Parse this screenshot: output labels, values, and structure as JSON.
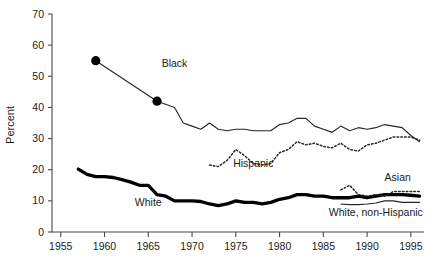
{
  "chart_data": {
    "type": "line",
    "title": "",
    "xlabel": "",
    "ylabel": "Percent",
    "xlim": [
      1954,
      1996.5
    ],
    "ylim": [
      0,
      70
    ],
    "ytick_values": [
      0,
      10,
      20,
      30,
      40,
      50,
      60,
      70
    ],
    "ytick_labels": [
      "0",
      "10",
      "20",
      "30",
      "40",
      "50",
      "60",
      "70"
    ],
    "xtick_values": [
      1955,
      1960,
      1965,
      1970,
      1975,
      1980,
      1985,
      1990,
      1995
    ],
    "xtick_labels": [
      "1955",
      "1960",
      "1965",
      "1970",
      "1975",
      "1980",
      "1985",
      "1990",
      "1995"
    ],
    "grid": false,
    "legend": "inline-labels",
    "series": [
      {
        "name": "Black",
        "label": "Black",
        "style": "thin-solid-with-markers",
        "label_x": 1968.0,
        "label_y": 53.0,
        "markers_at": [
          1959,
          1966
        ],
        "x": [
          1959,
          1966,
          1968,
          1969,
          1970,
          1971,
          1972,
          1973,
          1974,
          1975,
          1976,
          1977,
          1978,
          1979,
          1980,
          1981,
          1982,
          1983,
          1984,
          1985,
          1986,
          1987,
          1988,
          1989,
          1990,
          1991,
          1992,
          1993,
          1994,
          1995,
          1996
        ],
        "y": [
          55.0,
          42.0,
          40.0,
          35.0,
          34.0,
          33.0,
          35.0,
          33.0,
          32.5,
          33.0,
          33.0,
          32.5,
          32.5,
          32.5,
          34.5,
          35.0,
          36.5,
          36.5,
          34.0,
          33.0,
          32.0,
          34.0,
          32.5,
          33.5,
          33.0,
          33.5,
          34.5,
          34.0,
          33.5,
          31.0,
          29.0
        ]
      },
      {
        "name": "Hispanic",
        "label": "Hispanic",
        "style": "dotted",
        "label_x": 1977.0,
        "label_y": 21.0,
        "x": [
          1972,
          1973,
          1974,
          1975,
          1976,
          1977,
          1978,
          1979,
          1980,
          1981,
          1982,
          1983,
          1984,
          1985,
          1986,
          1987,
          1988,
          1989,
          1990,
          1991,
          1992,
          1993,
          1994,
          1995,
          1996
        ],
        "y": [
          21.5,
          21.0,
          23.0,
          26.5,
          24.5,
          22.0,
          21.5,
          22.0,
          25.5,
          26.5,
          29.0,
          28.0,
          28.5,
          27.5,
          27.0,
          28.5,
          26.5,
          26.0,
          28.0,
          28.5,
          29.5,
          30.5,
          30.5,
          30.5,
          29.5
        ]
      },
      {
        "name": "White",
        "label": "White",
        "style": "thick-solid",
        "label_x": 1965.0,
        "label_y": 8.5,
        "x": [
          1957,
          1958,
          1959,
          1960,
          1961,
          1962,
          1963,
          1964,
          1965,
          1966,
          1967,
          1968,
          1969,
          1970,
          1971,
          1972,
          1973,
          1974,
          1975,
          1976,
          1977,
          1978,
          1979,
          1980,
          1981,
          1982,
          1983,
          1984,
          1985,
          1986,
          1987,
          1988,
          1989,
          1990,
          1991,
          1992,
          1993,
          1994,
          1995,
          1996
        ],
        "y": [
          20.2,
          18.5,
          17.8,
          17.8,
          17.5,
          16.8,
          16.0,
          15.0,
          15.0,
          12.0,
          11.5,
          10.0,
          10.0,
          10.0,
          9.8,
          9.0,
          8.5,
          9.0,
          10.0,
          9.5,
          9.5,
          9.0,
          9.5,
          10.5,
          11.0,
          12.0,
          12.0,
          11.5,
          11.5,
          11.0,
          11.0,
          11.0,
          11.5,
          11.0,
          11.5,
          12.0,
          12.0,
          12.0,
          11.8,
          11.5
        ]
      },
      {
        "name": "Asian",
        "label": "Asian",
        "style": "dotted",
        "label_x": 1993.5,
        "label_y": 16.5,
        "x": [
          1987,
          1988,
          1989,
          1990,
          1991,
          1992,
          1993,
          1994,
          1995,
          1996
        ],
        "y": [
          13.5,
          15.0,
          12.0,
          11.5,
          12.0,
          11.5,
          13.0,
          13.0,
          13.0,
          13.0
        ]
      },
      {
        "name": "White, non-Hispanic",
        "label": "White, non-Hispanic",
        "style": "thin-solid",
        "label_x": 1991.0,
        "label_y": 5.0,
        "x": [
          1987,
          1988,
          1989,
          1990,
          1991,
          1992,
          1993,
          1994,
          1995,
          1996
        ],
        "y": [
          9.0,
          8.8,
          8.8,
          9.0,
          9.3,
          10.0,
          10.0,
          9.5,
          9.5,
          9.5
        ]
      }
    ]
  }
}
